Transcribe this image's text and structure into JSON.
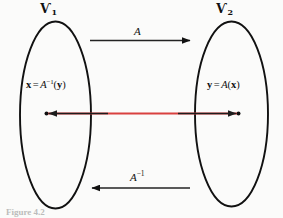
{
  "figure": {
    "background_color": "#fbfbfa",
    "stroke_color": "#111111",
    "accent_color": "#d9413f"
  },
  "spaces": {
    "left": {
      "symbol": "Ѵ",
      "subscript": "1",
      "name": "V1"
    },
    "right": {
      "symbol": "Ѵ",
      "subscript": "2",
      "name": "V2"
    }
  },
  "maps": {
    "forward": {
      "label": "A",
      "superscript": "",
      "direction": "right"
    },
    "inverse": {
      "label": "A",
      "superscript": "−1",
      "direction": "left"
    }
  },
  "equations": {
    "left": {
      "lhs": "x",
      "equals": "=",
      "operator": "A",
      "superscript": "−1",
      "open_paren": "(",
      "argument": "y",
      "close_paren": ")"
    },
    "right": {
      "lhs": "y",
      "equals": "=",
      "operator": "A",
      "superscript": "",
      "open_paren": "(",
      "argument": "x",
      "close_paren": ")"
    }
  },
  "caption": {
    "text": "Figure 4.2"
  }
}
